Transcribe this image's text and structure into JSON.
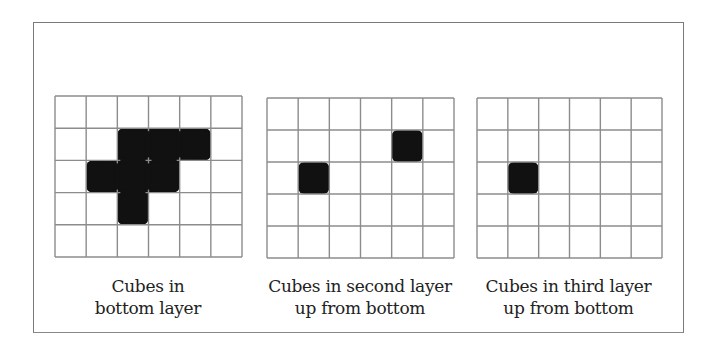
{
  "figure": {
    "grid_line_color": "#8c8c8c",
    "fill_color": "#111111",
    "panels": [
      {
        "name": "bottom-layer",
        "rows": 5,
        "cols": 6,
        "filled": [
          [
            1,
            2
          ],
          [
            1,
            3
          ],
          [
            1,
            4
          ],
          [
            2,
            1
          ],
          [
            2,
            2
          ],
          [
            2,
            3
          ],
          [
            3,
            2
          ]
        ],
        "caption_line1": "Cubes in",
        "caption_line2": "bottom layer"
      },
      {
        "name": "second-layer",
        "rows": 5,
        "cols": 6,
        "filled": [
          [
            1,
            4
          ],
          [
            2,
            1
          ]
        ],
        "caption_line1": "Cubes in second layer",
        "caption_line2": "up from bottom"
      },
      {
        "name": "third-layer",
        "rows": 5,
        "cols": 6,
        "filled": [
          [
            2,
            1
          ]
        ],
        "caption_line1": "Cubes in third layer",
        "caption_line2": "up from bottom"
      }
    ]
  }
}
